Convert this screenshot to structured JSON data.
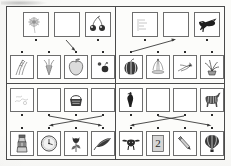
{
  "document": {
    "type": "worksheet",
    "title": "Picture matching worksheet",
    "description": "Scanned black-and-white worksheet divided into four panels; each panel has a top row and a bottom row of framed picture cards joined by arrows.",
    "panel_count": 4,
    "cards_per_row": 4,
    "rows_per_panel": 2,
    "page_background": "#fbfbf9",
    "frame_color": "#4a4a4a",
    "card_border_color": "#6d6d6d",
    "arrow_color": "#3a3a3a"
  },
  "panels": [
    {
      "id": "panel-top-left",
      "label": "Panel 1",
      "top_row": [
        {
          "id": "tl-t1",
          "icon": "dandelion-icon",
          "label": "dandelion",
          "empty": false
        },
        {
          "id": "tl-t2",
          "icon": "blank-icon",
          "label": "blank card",
          "empty": true
        },
        {
          "id": "tl-t3",
          "icon": "cherries-icon",
          "label": "cherries",
          "empty": false
        },
        {
          "id": "tl-t4",
          "icon": "none-icon",
          "label": "no card",
          "empty": true,
          "hidden": true
        }
      ],
      "bottom_row": [
        {
          "id": "tl-b1",
          "icon": "wheat-icon",
          "label": "wheat stalks",
          "empty": false
        },
        {
          "id": "tl-b2",
          "icon": "carrots-icon",
          "label": "carrots",
          "empty": false
        },
        {
          "id": "tl-b3",
          "icon": "apple-icon",
          "label": "apple",
          "empty": false
        },
        {
          "id": "tl-b4",
          "icon": "berries-icon",
          "label": "berries",
          "empty": false
        }
      ],
      "arrows": [
        {
          "from": "tl-t2",
          "to": "tl-b3",
          "label": "arrow from blank card to apple"
        }
      ]
    },
    {
      "id": "panel-top-right",
      "label": "Panel 2",
      "top_row": [
        {
          "id": "tr-t1",
          "icon": "ruled-lines-icon",
          "label": "ruled lines sheet",
          "empty": false
        },
        {
          "id": "tr-t2",
          "icon": "blank-icon",
          "label": "blank card",
          "empty": true
        },
        {
          "id": "tr-t3",
          "icon": "crow-icon",
          "label": "crow",
          "empty": false
        },
        {
          "id": "tr-t4",
          "icon": "none-icon",
          "label": "no card",
          "empty": true,
          "hidden": true
        }
      ],
      "bottom_row": [
        {
          "id": "tr-b1",
          "icon": "watermelon-icon",
          "label": "watermelon",
          "empty": false
        },
        {
          "id": "tr-b2",
          "icon": "fountain-icon",
          "label": "fountain",
          "empty": false
        },
        {
          "id": "tr-b3",
          "icon": "dragonfly-icon",
          "label": "dragonfly",
          "empty": false
        },
        {
          "id": "tr-b4",
          "icon": "potted-plant-icon",
          "label": "potted plant",
          "empty": false
        }
      ],
      "arrows": [
        {
          "from": "tr-t2",
          "to": "tr-b1",
          "label": "arrow from blank card to watermelon"
        }
      ]
    },
    {
      "id": "panel-bottom-left",
      "label": "Panel 3",
      "top_row": [
        {
          "id": "bl-t1",
          "icon": "scribble-icon",
          "label": "faint scribble",
          "empty": false
        },
        {
          "id": "bl-t2",
          "icon": "blank-icon",
          "label": "blank card",
          "empty": true
        },
        {
          "id": "bl-t3",
          "icon": "basket-icon",
          "label": "basket",
          "empty": false
        },
        {
          "id": "bl-t4",
          "icon": "blank-icon",
          "label": "blank card",
          "empty": true
        }
      ],
      "bottom_row": [
        {
          "id": "bl-b1",
          "icon": "lantern-icon",
          "label": "lantern",
          "empty": false
        },
        {
          "id": "bl-b2",
          "icon": "clock-icon",
          "label": "clock",
          "empty": false
        },
        {
          "id": "bl-b3",
          "icon": "tulip-icon",
          "label": "tulip",
          "empty": false
        },
        {
          "id": "bl-b4",
          "icon": "feather-icon",
          "label": "feather",
          "empty": false
        }
      ],
      "arrows": [
        {
          "from": "bl-t2",
          "to": "bl-b4",
          "label": "arrow from second blank card to feather"
        },
        {
          "from": "bl-t4",
          "to": "bl-b2",
          "label": "arrow from fourth blank card to clock"
        }
      ]
    },
    {
      "id": "panel-bottom-right",
      "label": "Panel 4",
      "top_row": [
        {
          "id": "br-t1",
          "icon": "rooster-icon",
          "label": "rooster",
          "empty": false
        },
        {
          "id": "br-t2",
          "icon": "blank-icon",
          "label": "blank card",
          "empty": true
        },
        {
          "id": "br-t3",
          "icon": "blank-icon",
          "label": "blank card",
          "empty": true
        },
        {
          "id": "br-t4",
          "icon": "zebra-icon",
          "label": "zebra",
          "empty": false
        }
      ],
      "bottom_row": [
        {
          "id": "br-b1",
          "icon": "bull-icon",
          "label": "bull",
          "empty": false
        },
        {
          "id": "br-b2",
          "icon": "number-card-icon",
          "label": "number card",
          "empty": false
        },
        {
          "id": "br-b3",
          "icon": "pencil-icon",
          "label": "pencil",
          "empty": false
        },
        {
          "id": "br-b4",
          "icon": "balloon-icon",
          "label": "hot air balloon",
          "empty": false
        }
      ],
      "arrows": [
        {
          "from": "br-t2",
          "to": "br-b4",
          "label": "arrow from second blank card to hot air balloon"
        },
        {
          "from": "br-t3",
          "to": "br-b1",
          "label": "arrow from third blank card to bull"
        }
      ]
    }
  ]
}
